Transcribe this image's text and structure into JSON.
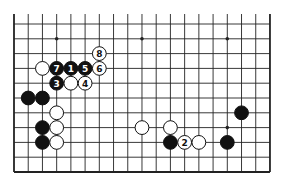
{
  "diagram": {
    "type": "go-board-fragment",
    "columns": 19,
    "rows": 11,
    "open_edge": "top",
    "star_points": [
      {
        "col": 3,
        "row": 1
      },
      {
        "col": 9,
        "row": 1
      },
      {
        "col": 15,
        "row": 1
      },
      {
        "col": 3,
        "row": 7
      },
      {
        "col": 9,
        "row": 7
      },
      {
        "col": 15,
        "row": 7
      }
    ],
    "stones": [
      {
        "color": "white",
        "col": 6,
        "row": 2,
        "label": "8"
      },
      {
        "color": "white",
        "col": 2,
        "row": 3,
        "label": ""
      },
      {
        "color": "black",
        "col": 3,
        "row": 3,
        "label": "7"
      },
      {
        "color": "black",
        "col": 4,
        "row": 3,
        "label": "1"
      },
      {
        "color": "black",
        "col": 5,
        "row": 3,
        "label": "5"
      },
      {
        "color": "white",
        "col": 6,
        "row": 3,
        "label": "6"
      },
      {
        "color": "black",
        "col": 3,
        "row": 4,
        "label": "3"
      },
      {
        "color": "white",
        "col": 4,
        "row": 4,
        "label": ""
      },
      {
        "color": "white",
        "col": 5,
        "row": 4,
        "label": "4"
      },
      {
        "color": "black",
        "col": 1,
        "row": 5,
        "label": ""
      },
      {
        "color": "black",
        "col": 2,
        "row": 5,
        "label": ""
      },
      {
        "color": "white",
        "col": 3,
        "row": 6,
        "label": ""
      },
      {
        "color": "black",
        "col": 2,
        "row": 7,
        "label": ""
      },
      {
        "color": "white",
        "col": 3,
        "row": 7,
        "label": ""
      },
      {
        "color": "black",
        "col": 2,
        "row": 8,
        "label": ""
      },
      {
        "color": "white",
        "col": 3,
        "row": 8,
        "label": ""
      },
      {
        "color": "white",
        "col": 9,
        "row": 7,
        "label": ""
      },
      {
        "color": "white",
        "col": 11,
        "row": 7,
        "label": ""
      },
      {
        "color": "black",
        "col": 11,
        "row": 8,
        "label": ""
      },
      {
        "color": "white",
        "col": 12,
        "row": 8,
        "label": "2"
      },
      {
        "color": "white",
        "col": 13,
        "row": 8,
        "label": ""
      },
      {
        "color": "black",
        "col": 15,
        "row": 8,
        "label": ""
      },
      {
        "color": "black",
        "col": 16,
        "row": 6,
        "label": ""
      }
    ],
    "colors": {
      "background": "#ffffff",
      "line": "#222222",
      "black_stone": "#111111",
      "white_stone": "#ffffff",
      "label_on_black": "#ffffff",
      "label_on_white": "#111111"
    }
  }
}
